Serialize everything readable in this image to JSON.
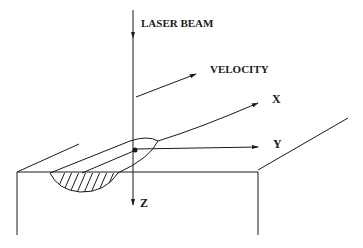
{
  "diagram": {
    "labels": {
      "laser_beam": "LASER BEAM",
      "velocity": "VELOCITY",
      "x_axis": "X",
      "y_axis": "Y",
      "z_axis": "Z"
    },
    "colors": {
      "ink": "#1a1a1a",
      "background": "#ffffff"
    }
  }
}
